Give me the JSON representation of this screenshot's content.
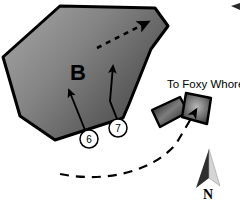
{
  "figure": {
    "type": "site-plan-map",
    "background_color": "#ffffff",
    "block_label": "B",
    "destination_label": "To Foxy Whore",
    "north_label": "N",
    "callouts": [
      {
        "id": "6",
        "label": "6",
        "cx": 89,
        "cy": 139,
        "r": 9
      },
      {
        "id": "7",
        "label": "7",
        "cx": 118,
        "cy": 128,
        "r": 9
      }
    ]
  },
  "colors": {
    "block_fill_light": "#9a9a9a",
    "block_fill_dark": "#4a4a4a",
    "block_outline": "#000000",
    "building_fill_light": "#a8a8a8",
    "building_fill_dark": "#2b2b2b",
    "ink": "#000000",
    "north_arrow_light": "#d9d9d9",
    "north_arrow_dark": "#333333",
    "path_dash": "#1a1a1a"
  },
  "geometry": {
    "block_polygon": "60,6 155,8 168,26 151,49 129,104 123,118 55,140 20,116 3,57",
    "building_a_polygon": "152,110 180,97 188,112 160,127",
    "building_b_polygon": "186,93 211,98 207,124 182,117",
    "arrow_6": {
      "x1": 85,
      "y1": 130,
      "x2": 68,
      "y2": 88
    },
    "arrow_7": {
      "x1": 117,
      "y1": 118,
      "x2": 113,
      "y2": 65
    },
    "dashed_block_arrow": {
      "x1": 97,
      "y1": 48,
      "x2": 152,
      "y2": 20
    },
    "dashed_route": "M 68,173 C 110,181 155,170 178,143 L 198,108",
    "north_arrow_tip": {
      "x": 209,
      "y": 150
    },
    "north_arrow_base_left": {
      "x": 195,
      "y": 188
    },
    "north_arrow_base_right": {
      "x": 219,
      "y": 186
    }
  },
  "legend_notes": {
    "block_gradient_direction": "light-upper-left to dark-lower-right",
    "grid_visible": false
  }
}
